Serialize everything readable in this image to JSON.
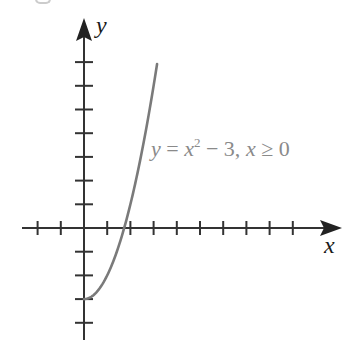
{
  "figure": {
    "axis_labels": {
      "x": "x",
      "y": "y"
    },
    "equation": {
      "lhs": "y",
      "eq": " = ",
      "base": "x",
      "exp": "2",
      "rest_minus": " − 3, ",
      "cond_var": "x",
      "cond_op": " ≥ 0"
    },
    "colors": {
      "axis": "#333333",
      "curve": "#7a7a7a",
      "equation": "#8a8a8a"
    }
  },
  "chart_data": {
    "type": "line",
    "title": "",
    "xlabel": "x",
    "ylabel": "y",
    "annotation": "y = x^2 − 3, x ≥ 0",
    "function": "y = x^2 - 3 (x >= 0)",
    "x_ticks": [
      -2,
      -1,
      1,
      2,
      3,
      4,
      5,
      6,
      7,
      8,
      9
    ],
    "y_ticks": [
      -4,
      -3,
      -2,
      -1,
      1,
      2,
      3,
      4,
      5,
      6,
      7
    ],
    "xlim": [
      -2.7,
      11
    ],
    "ylim": [
      -4.8,
      8.7
    ],
    "tick_labels_shown": false,
    "grid": false,
    "x": [
      0,
      0.5,
      1,
      1.5,
      1.732,
      2,
      2.5,
      3,
      3.15
    ],
    "y": [
      -3,
      -2.75,
      -2,
      -0.75,
      0,
      1,
      3.25,
      6,
      6.92
    ]
  }
}
